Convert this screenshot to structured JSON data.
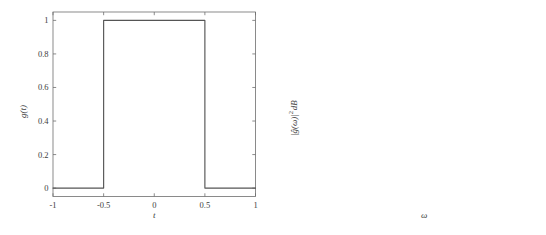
{
  "figure": {
    "title": "",
    "background": "#ffffff",
    "line_color": "#555555",
    "axis_color": "#6e6e6e"
  },
  "panels": [
    {
      "id": "left",
      "xlabel": "t",
      "ylabel": "g(t)",
      "xticklabels": [
        "-1",
        "-0.5",
        "0",
        "0.5",
        "1"
      ],
      "yticklabels": [
        "0",
        "0.2",
        "0.4",
        "0.6",
        "0.8",
        "1"
      ]
    },
    {
      "id": "right",
      "xlabel": "ω",
      "ylabel_parts": {
        "magnitude": "|ĝ(ω)|",
        "exponent": "2",
        "units": "dB"
      },
      "xticklabels": [
        "-50",
        "0",
        "50"
      ],
      "yticklabels": [
        "0",
        "-20",
        "-40",
        "-60",
        "-80",
        "-100",
        "-120",
        "-140"
      ]
    }
  ],
  "chart_data": [
    {
      "type": "line",
      "title": "",
      "xlabel": "t",
      "ylabel": "g(t)",
      "xlim": [
        -1,
        1
      ],
      "ylim": [
        -0.05,
        1.05
      ],
      "xticks": [
        -1,
        -0.5,
        0,
        0.5,
        1
      ],
      "yticks": [
        0,
        0.2,
        0.4,
        0.6,
        0.8,
        1
      ],
      "grid": false,
      "legend": null,
      "description": "Rectangular pulse: g(t) = 1 for |t| < 0.5, else 0",
      "x": [
        -1,
        -0.5,
        -0.5,
        0.5,
        0.5,
        1
      ],
      "y": [
        0,
        0,
        1,
        1,
        0,
        0
      ]
    },
    {
      "type": "line",
      "title": "",
      "xlabel": "ω",
      "ylabel": "|ĝ(ω)|² dB",
      "xlim": [
        -50,
        50
      ],
      "ylim": [
        -140,
        0
      ],
      "xticks": [
        -50,
        0,
        50
      ],
      "yticks": [
        0,
        -20,
        -40,
        -60,
        -80,
        -100,
        -120,
        -140
      ],
      "grid": false,
      "legend": null,
      "description": "Power spectrum of rectangular pulse, 20*log10(|sinc|^2) pattern in dB; main lobe peak near -16 dB at omega = 0, sidelobe nulls reaching between -95 and -137 dB",
      "formula": "10*log10(|sin(w/2)/(w/2)|^2 * A) with A chosen so peak = -16.2 dB",
      "peak_db": -16.2,
      "peak_omega": 0,
      "sidelobe_peaks_db": [
        -44,
        -52,
        -57,
        -61,
        -64,
        -67,
        -69,
        -71,
        -73,
        -74,
        -76,
        -77
      ],
      "null_omegas": [
        -44.0,
        -37.7,
        -31.4,
        -25.1,
        -18.8,
        -12.6,
        -6.3,
        6.3,
        12.6,
        18.8,
        25.1,
        31.4,
        37.7,
        44.0
      ],
      "null_depths_db": [
        -137,
        -110,
        -96,
        -109,
        -110,
        -97,
        -110,
        -110,
        -97,
        -110,
        -109,
        -96,
        -110,
        -137
      ]
    }
  ]
}
